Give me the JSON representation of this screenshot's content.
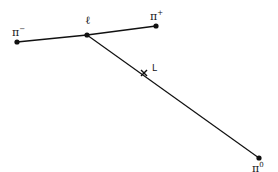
{
  "diagram": {
    "points": {
      "pi_minus": {
        "label": "π",
        "sup": "−",
        "x": 17,
        "y": 42
      },
      "ell": {
        "label": "ℓ",
        "x": 87,
        "y": 35
      },
      "pi_plus": {
        "label": "π",
        "sup": "+",
        "x": 156,
        "y": 26
      },
      "pi_zero": {
        "label": "π",
        "sup": "0",
        "x": 259,
        "y": 158
      },
      "L": {
        "label": "L",
        "x": 144,
        "y": 73
      }
    },
    "line_color": "#111111"
  }
}
